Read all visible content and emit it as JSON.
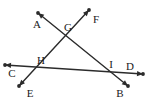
{
  "figure": {
    "type": "geometry-diagram",
    "width": 146,
    "height": 104,
    "background_color": "#ffffff",
    "stroke_color": "#2b2b2b",
    "label_color": "#1a1a1a",
    "stroke_width": 1.4
  },
  "points": [
    {
      "id": "A",
      "label": "A",
      "label_x": 37,
      "label_y": 24,
      "kind": "ray-endpoint"
    },
    {
      "id": "F",
      "label": "F",
      "label_x": 96,
      "label_y": 19,
      "kind": "ray-endpoint"
    },
    {
      "id": "G",
      "label": "G",
      "label_x": 68,
      "label_y": 27,
      "kind": "intersection"
    },
    {
      "id": "H",
      "label": "H",
      "label_x": 41,
      "label_y": 60,
      "kind": "intersection"
    },
    {
      "id": "I",
      "label": "I",
      "label_x": 111,
      "label_y": 64,
      "kind": "intersection"
    },
    {
      "id": "C",
      "label": "C",
      "label_x": 12,
      "label_y": 73,
      "kind": "ray-endpoint"
    },
    {
      "id": "D",
      "label": "D",
      "label_x": 130,
      "label_y": 66,
      "kind": "ray-endpoint"
    },
    {
      "id": "E",
      "label": "E",
      "label_x": 30,
      "label_y": 93,
      "kind": "ray-endpoint"
    },
    {
      "id": "B",
      "label": "B",
      "label_x": 120,
      "label_y": 93,
      "kind": "ray-endpoint"
    }
  ],
  "lines": [
    {
      "id": "line-AB",
      "name": "line-A-G-I-B",
      "through": "A, G, I, B",
      "x1": 38,
      "y1": 13,
      "x2": 128,
      "y2": 86,
      "arrow_start": true,
      "arrow_end": true
    },
    {
      "id": "line-EF",
      "name": "line-E-H-G-F",
      "through": "E, H, G, F",
      "x1": 19,
      "y1": 86,
      "x2": 89,
      "y2": 10,
      "arrow_start": true,
      "arrow_end": true
    },
    {
      "id": "line-CD",
      "name": "line-C-H-I-D",
      "through": "C, H, I, D",
      "x1": 5,
      "y1": 65,
      "x2": 143,
      "y2": 74,
      "arrow_start": true,
      "arrow_end": true
    }
  ],
  "dots": [
    {
      "id": "dot-A",
      "name": "endpoint-dot-A",
      "x": 38,
      "y": 13
    },
    {
      "id": "dot-F",
      "name": "endpoint-dot-F",
      "x": 89,
      "y": 10
    },
    {
      "id": "dot-C",
      "name": "endpoint-dot-C",
      "x": 5,
      "y": 65
    },
    {
      "id": "dot-D",
      "name": "endpoint-dot-D",
      "x": 143,
      "y": 74
    },
    {
      "id": "dot-E",
      "name": "endpoint-dot-E",
      "x": 19,
      "y": 86
    },
    {
      "id": "dot-B",
      "name": "endpoint-dot-B",
      "x": 128,
      "y": 86
    }
  ]
}
